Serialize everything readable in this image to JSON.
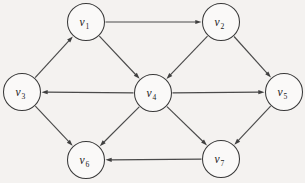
{
  "figure": {
    "background_color": "#f4f2f0",
    "node_fill_color": "#faf9f8",
    "node_stroke_color": "#3a3a3a",
    "edge_color": "#4a4a4a",
    "arrow_color": "#3f3f3f",
    "label_color": "#1b1b1b",
    "width": 305,
    "height": 183,
    "node_radius": 18.5
  },
  "nodes": [
    {
      "id": "v1",
      "symbol": "v",
      "subscript": "1",
      "label": "v1",
      "cx": 86,
      "cy": 22
    },
    {
      "id": "v2",
      "symbol": "v",
      "subscript": "2",
      "label": "v2",
      "cx": 221,
      "cy": 22
    },
    {
      "id": "v3",
      "symbol": "v",
      "subscript": "3",
      "label": "v3",
      "cx": 22,
      "cy": 92
    },
    {
      "id": "v4",
      "symbol": "v",
      "subscript": "4",
      "label": "v4",
      "cx": 153,
      "cy": 93
    },
    {
      "id": "v5",
      "symbol": "v",
      "subscript": "5",
      "label": "v5",
      "cx": 284,
      "cy": 92
    },
    {
      "id": "v6",
      "symbol": "v",
      "subscript": "6",
      "label": "v6",
      "cx": 86,
      "cy": 160
    },
    {
      "id": "v7",
      "symbol": "v",
      "subscript": "7",
      "label": "v7",
      "cx": 221,
      "cy": 159
    }
  ],
  "edges": [
    {
      "from": "v1",
      "to": "v2",
      "directed": true
    },
    {
      "from": "v1",
      "to": "v4",
      "directed": true
    },
    {
      "from": "v3",
      "to": "v1",
      "directed": true
    },
    {
      "from": "v2",
      "to": "v4",
      "directed": true
    },
    {
      "from": "v2",
      "to": "v5",
      "directed": true
    },
    {
      "from": "v4",
      "to": "v3",
      "directed": true
    },
    {
      "from": "v4",
      "to": "v5",
      "directed": true
    },
    {
      "from": "v4",
      "to": "v6",
      "directed": true
    },
    {
      "from": "v4",
      "to": "v7",
      "directed": true
    },
    {
      "from": "v3",
      "to": "v6",
      "directed": true
    },
    {
      "from": "v5",
      "to": "v7",
      "directed": true
    },
    {
      "from": "v7",
      "to": "v6",
      "directed": true
    }
  ]
}
